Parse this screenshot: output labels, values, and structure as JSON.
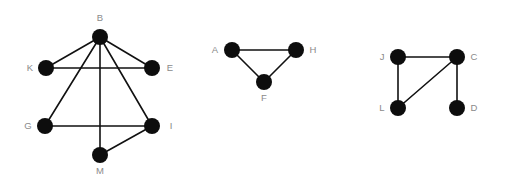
{
  "figure": {
    "type": "node-link-graph-collection",
    "background_color": "#ffffff",
    "node_color": "#0d0d0d",
    "edge_color": "#111111",
    "label_color": "#8a8a8a",
    "node_radius": 8,
    "edge_width": 1.6,
    "graph_count": 3
  },
  "graphs": [
    {
      "id": "graph-1",
      "name": "left-graph",
      "node_count": 6,
      "edge_count": 8,
      "nodes": [
        {
          "id": "B",
          "label": "B",
          "cx": 100,
          "cy": 37,
          "label_x": 100,
          "label_y": 21,
          "label_anchor": "middle"
        },
        {
          "id": "K",
          "label": "K",
          "cx": 46,
          "cy": 68,
          "label_x": 30,
          "label_y": 71,
          "label_anchor": "middle"
        },
        {
          "id": "E",
          "label": "E",
          "cx": 152,
          "cy": 68,
          "label_x": 170,
          "label_y": 71,
          "label_anchor": "middle"
        },
        {
          "id": "G",
          "label": "G",
          "cx": 45,
          "cy": 126,
          "label_x": 28,
          "label_y": 129,
          "label_anchor": "middle"
        },
        {
          "id": "I",
          "label": "I",
          "cx": 152,
          "cy": 126,
          "label_x": 171,
          "label_y": 129,
          "label_anchor": "middle"
        },
        {
          "id": "M",
          "label": "M",
          "cx": 100,
          "cy": 155,
          "label_x": 100,
          "label_y": 174,
          "label_anchor": "middle"
        }
      ],
      "edges": [
        {
          "from": "B",
          "to": "K"
        },
        {
          "from": "B",
          "to": "E"
        },
        {
          "from": "B",
          "to": "G"
        },
        {
          "from": "B",
          "to": "I"
        },
        {
          "from": "B",
          "to": "M"
        },
        {
          "from": "K",
          "to": "E"
        },
        {
          "from": "G",
          "to": "I"
        },
        {
          "from": "M",
          "to": "I"
        }
      ]
    },
    {
      "id": "graph-2",
      "name": "middle-graph",
      "node_count": 3,
      "edge_count": 3,
      "nodes": [
        {
          "id": "A",
          "label": "A",
          "cx": 232,
          "cy": 50,
          "label_x": 215,
          "label_y": 53,
          "label_anchor": "middle"
        },
        {
          "id": "H",
          "label": "H",
          "cx": 296,
          "cy": 50,
          "label_x": 313,
          "label_y": 53,
          "label_anchor": "middle"
        },
        {
          "id": "F",
          "label": "F",
          "cx": 264,
          "cy": 82,
          "label_x": 264,
          "label_y": 101,
          "label_anchor": "middle"
        }
      ],
      "edges": [
        {
          "from": "A",
          "to": "H"
        },
        {
          "from": "A",
          "to": "F"
        },
        {
          "from": "F",
          "to": "H"
        }
      ]
    },
    {
      "id": "graph-3",
      "name": "right-graph",
      "node_count": 4,
      "edge_count": 4,
      "nodes": [
        {
          "id": "J",
          "label": "J",
          "cx": 398,
          "cy": 57,
          "label_x": 382,
          "label_y": 60,
          "label_anchor": "middle"
        },
        {
          "id": "C",
          "label": "C",
          "cx": 457,
          "cy": 57,
          "label_x": 474,
          "label_y": 60,
          "label_anchor": "middle"
        },
        {
          "id": "L",
          "label": "L",
          "cx": 398,
          "cy": 108,
          "label_x": 382,
          "label_y": 111,
          "label_anchor": "middle"
        },
        {
          "id": "D",
          "label": "D",
          "cx": 457,
          "cy": 108,
          "label_x": 474,
          "label_y": 111,
          "label_anchor": "middle"
        }
      ],
      "edges": [
        {
          "from": "J",
          "to": "C"
        },
        {
          "from": "J",
          "to": "L"
        },
        {
          "from": "L",
          "to": "C"
        },
        {
          "from": "C",
          "to": "D"
        }
      ]
    }
  ]
}
